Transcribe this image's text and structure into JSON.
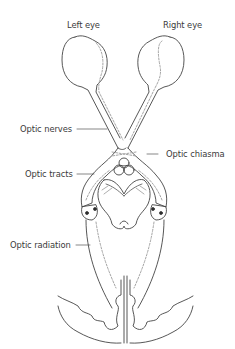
{
  "diagram": {
    "labels": {
      "left_eye": "Left eye",
      "right_eye": "Right eye",
      "optic_nerves": "Optic nerves",
      "optic_chiasma": "Optic chiasma",
      "optic_tracts": "Optic tracts",
      "optic_radiation": "Optic radiation"
    },
    "colors": {
      "stroke": "#444444",
      "dashed": "#9a9a9a",
      "text": "#3a3a3a",
      "background": "#ffffff"
    }
  }
}
